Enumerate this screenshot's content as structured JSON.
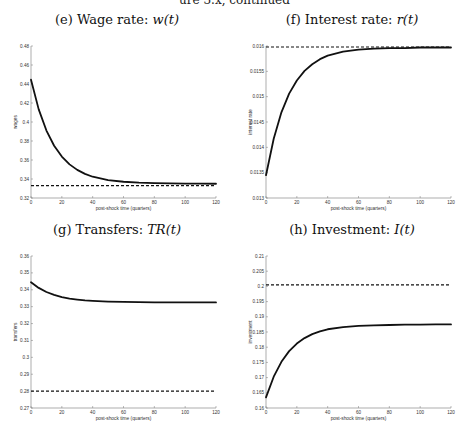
{
  "page": {
    "header_fragment": "ure 3.x, continued"
  },
  "chart_data": [
    {
      "id": "e",
      "type": "line",
      "title_prefix": "(e) Wage rate: ",
      "title_math": "w(t)",
      "xlabel": "post-shock time (quarters)",
      "ylabel": "wages",
      "xlim": [
        0,
        120
      ],
      "ylim": [
        0.32,
        0.48
      ],
      "xticks": [
        0,
        20,
        40,
        60,
        80,
        100,
        120
      ],
      "xtick_labels": [
        "0",
        "20",
        "40",
        "60",
        "80",
        "100",
        "120"
      ],
      "yticks": [
        0.32,
        0.34,
        0.36,
        0.38,
        0.4,
        0.42,
        0.44,
        0.46,
        0.48
      ],
      "ytick_labels": [
        "0.32",
        "0.34",
        "0.36",
        "0.38",
        "0.4",
        "0.42",
        "0.44",
        "0.46",
        "0.48"
      ],
      "grid": false,
      "series": [
        {
          "name": "transition path",
          "style": "solid",
          "x": [
            0,
            5,
            10,
            15,
            20,
            25,
            30,
            35,
            40,
            50,
            60,
            70,
            80,
            90,
            100,
            110,
            120
          ],
          "y": [
            0.4445,
            0.4133,
            0.391,
            0.375,
            0.3636,
            0.3554,
            0.3496,
            0.3454,
            0.3424,
            0.3389,
            0.3371,
            0.3362,
            0.3357,
            0.3354,
            0.3352,
            0.3351,
            0.335
          ]
        },
        {
          "name": "steady state",
          "style": "dashed",
          "x": [
            0,
            120
          ],
          "y": [
            0.333,
            0.333
          ]
        }
      ]
    },
    {
      "id": "f",
      "type": "line",
      "title_prefix": "(f) Interest rate: ",
      "title_math": "r(t)",
      "xlabel": "post-shock time (quarters)",
      "ylabel": "interest rate",
      "xlim": [
        0,
        120
      ],
      "ylim": [
        0.013,
        0.016
      ],
      "xticks": [
        0,
        20,
        40,
        60,
        80,
        100,
        120
      ],
      "xtick_labels": [
        "0",
        "20",
        "40",
        "60",
        "80",
        "100",
        "120"
      ],
      "yticks": [
        0.013,
        0.0135,
        0.014,
        0.0145,
        0.015,
        0.0155,
        0.016
      ],
      "ytick_labels": [
        "0.013",
        "0.0135",
        "0.014",
        "0.0145",
        "0.015",
        "0.0155",
        "0.016"
      ],
      "grid": false,
      "series": [
        {
          "name": "transition path",
          "style": "solid",
          "x": [
            0,
            5,
            10,
            15,
            20,
            25,
            30,
            35,
            40,
            50,
            60,
            70,
            80,
            90,
            100,
            110,
            120
          ],
          "y": [
            0.01345,
            0.01417,
            0.01469,
            0.01506,
            0.01532,
            0.01551,
            0.01564,
            0.01574,
            0.01581,
            0.01589,
            0.01593,
            0.01595,
            0.01596,
            0.01596,
            0.01597,
            0.01597,
            0.01597
          ]
        },
        {
          "name": "steady state",
          "style": "dashed",
          "x": [
            0,
            120
          ],
          "y": [
            0.01598,
            0.01598
          ]
        }
      ]
    },
    {
      "id": "g",
      "type": "line",
      "title_prefix": "(g) Transfers: ",
      "title_math": "TR(t)",
      "xlabel": "post-shock time (quarters)",
      "ylabel": "transfers",
      "xlim": [
        0,
        120
      ],
      "ylim": [
        0.27,
        0.36
      ],
      "xticks": [
        0,
        20,
        40,
        60,
        80,
        100,
        120
      ],
      "xtick_labels": [
        "0",
        "20",
        "40",
        "60",
        "80",
        "100",
        "120"
      ],
      "yticks": [
        0.27,
        0.28,
        0.29,
        0.3,
        0.31,
        0.32,
        0.33,
        0.34,
        0.35,
        0.36
      ],
      "ytick_labels": [
        "0.27",
        "0.28",
        "0.29",
        "0.3",
        "0.31",
        "0.32",
        "0.33",
        "0.34",
        "0.35",
        "0.36"
      ],
      "grid": false,
      "series": [
        {
          "name": "transition path",
          "style": "solid",
          "x": [
            0,
            5,
            10,
            15,
            20,
            25,
            30,
            35,
            40,
            50,
            60,
            70,
            80,
            90,
            100,
            110,
            120
          ],
          "y": [
            0.3445,
            0.3411,
            0.3387,
            0.337,
            0.3357,
            0.3348,
            0.3342,
            0.3337,
            0.3334,
            0.333,
            0.3328,
            0.3327,
            0.3326,
            0.3326,
            0.3325,
            0.3325,
            0.3325
          ]
        },
        {
          "name": "steady state",
          "style": "dashed",
          "x": [
            0,
            120
          ],
          "y": [
            0.28,
            0.28
          ]
        }
      ]
    },
    {
      "id": "h",
      "type": "line",
      "title_prefix": "(h) Investment: ",
      "title_math": "I(t)",
      "xlabel": "post-shock time (quarters)",
      "ylabel": "investment",
      "xlim": [
        0,
        120
      ],
      "ylim": [
        0.16,
        0.21
      ],
      "xticks": [
        0,
        20,
        40,
        60,
        80,
        100,
        120
      ],
      "xtick_labels": [
        "0",
        "20",
        "40",
        "60",
        "80",
        "100",
        "120"
      ],
      "yticks": [
        0.16,
        0.165,
        0.17,
        0.175,
        0.18,
        0.185,
        0.19,
        0.195,
        0.2,
        0.205,
        0.21
      ],
      "ytick_labels": [
        "0.16",
        "0.165",
        "0.17",
        "0.175",
        "0.18",
        "0.185",
        "0.19",
        "0.195",
        "0.2",
        "0.205",
        "0.21"
      ],
      "grid": false,
      "series": [
        {
          "name": "transition path",
          "style": "solid",
          "x": [
            0,
            5,
            10,
            15,
            20,
            25,
            30,
            35,
            40,
            50,
            60,
            70,
            80,
            90,
            100,
            110,
            120
          ],
          "y": [
            0.1635,
            0.1703,
            0.1752,
            0.1787,
            0.1812,
            0.183,
            0.1843,
            0.1852,
            0.1859,
            0.1866,
            0.187,
            0.1872,
            0.1873,
            0.1874,
            0.1874,
            0.1875,
            0.1875
          ]
        },
        {
          "name": "steady state",
          "style": "dashed",
          "x": [
            0,
            120
          ],
          "y": [
            0.2005,
            0.2005
          ]
        }
      ]
    }
  ]
}
